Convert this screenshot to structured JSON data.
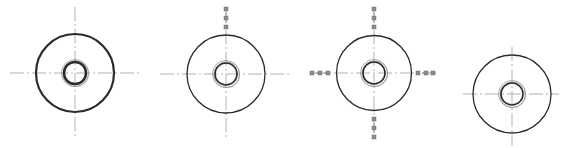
{
  "diagram": {
    "title": "",
    "colors": {
      "background": "#ffffff",
      "outline": "#2b2b2b",
      "centerline": "#a8a8a8",
      "inner_ring": "#8a8a8a",
      "grip": "#8c8c8c"
    },
    "figures": [
      {
        "id": "figure-1",
        "description": "washer with bold outline, centerlines",
        "cx": 75,
        "cy": 73,
        "outer_r": 39,
        "inner_r": 11,
        "ring_r": 13.5,
        "stroke_width": 2.2,
        "centerline": {
          "h": [
            10,
            140
          ],
          "v": [
            7,
            138
          ]
        },
        "grips": []
      },
      {
        "id": "figure-2",
        "description": "washer with grip on top centerline",
        "cx": 226,
        "cy": 74,
        "outer_r": 39,
        "inner_r": 11,
        "ring_r": 13.5,
        "stroke_width": 1.3,
        "centerline": {
          "h": [
            160,
            290
          ],
          "v": [
            8,
            140
          ]
        },
        "grips": [
          {
            "dir": "top",
            "points": [
              [
                226,
                9
              ],
              [
                226,
                18
              ],
              [
                226,
                27
              ]
            ]
          }
        ]
      },
      {
        "id": "figure-3",
        "description": "washer with grips on all four centerline ends",
        "cx": 374,
        "cy": 73,
        "outer_r": 37.5,
        "inner_r": 11,
        "ring_r": 13.5,
        "stroke_width": 1.3,
        "centerline": {
          "h": [
            312,
            436
          ],
          "v": [
            8,
            139
          ]
        },
        "grips": [
          {
            "dir": "top",
            "points": [
              [
                374,
                9
              ],
              [
                374,
                18
              ],
              [
                374,
                27
              ]
            ]
          },
          {
            "dir": "bottom",
            "points": [
              [
                374,
                119
              ],
              [
                374,
                128
              ],
              [
                374,
                137
              ]
            ]
          },
          {
            "dir": "left",
            "points": [
              [
                312,
                73
              ],
              [
                320,
                73
              ],
              [
                328,
                73
              ]
            ]
          },
          {
            "dir": "right",
            "points": [
              [
                418,
                73
              ],
              [
                426,
                73
              ],
              [
                433,
                73
              ]
            ]
          }
        ]
      },
      {
        "id": "figure-4",
        "description": "washer shifted lower, centerlines",
        "cx": 512,
        "cy": 94,
        "outer_r": 39,
        "inner_r": 11,
        "ring_r": 13.5,
        "stroke_width": 1.3,
        "centerline": {
          "h": [
            463,
            559
          ],
          "v": [
            47,
            146
          ]
        },
        "grips": []
      }
    ]
  }
}
